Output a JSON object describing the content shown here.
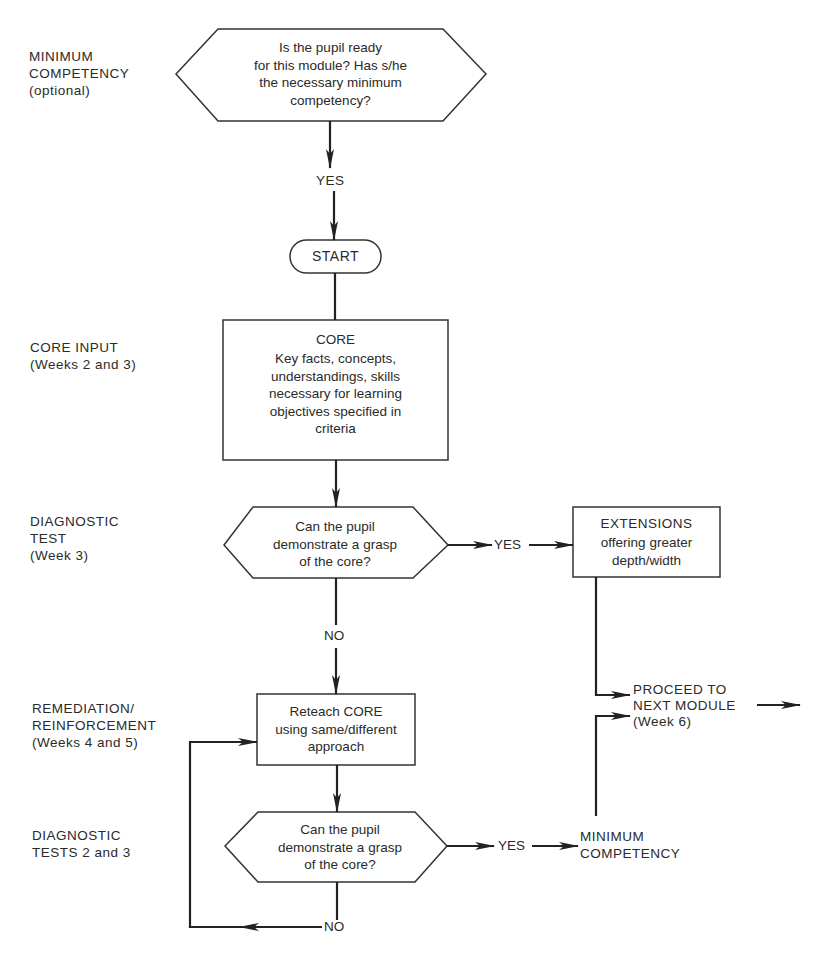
{
  "stage_labels": {
    "minimum_competency": "MINIMUM\nCOMPETENCY\n(optional)",
    "core_input": "CORE INPUT\n(Weeks 2 and 3)",
    "diagnostic_test": "DIAGNOSTIC\nTEST\n(Week 3)",
    "remediation": "REMEDIATION/\nREINFORCEMENT\n(Weeks 4 and 5)",
    "diagnostic_tests_2_3": "DIAGNOSTIC\nTESTS 2 and 3"
  },
  "nodes": {
    "readiness_question": "Is the pupil ready\nfor this module? Has s/he\nthe necessary minimum\ncompetency?",
    "start": "START",
    "core_title": "CORE",
    "core_body": "Key facts, concepts,\nunderstandings, skills\nnecessary for learning\nobjectives specified in\ncriteria",
    "diag1_question": "Can the pupil\ndemonstrate a grasp\nof the core?",
    "extensions_title": "EXTENSIONS",
    "extensions_body": "offering greater\ndepth/width",
    "reteach": "Reteach CORE\nusing same/different\napproach",
    "diag2_question": "Can the pupil\ndemonstrate a grasp\nof the core?",
    "minimum_competency_outcome": "MINIMUM\nCOMPETENCY",
    "proceed": "PROCEED TO\nNEXT MODULE\n(Week 6)"
  },
  "edges": {
    "yes_ready": "YES",
    "yes_diag1": "YES",
    "no_diag1": "NO",
    "yes_diag2": "YES",
    "no_diag2": "NO"
  }
}
